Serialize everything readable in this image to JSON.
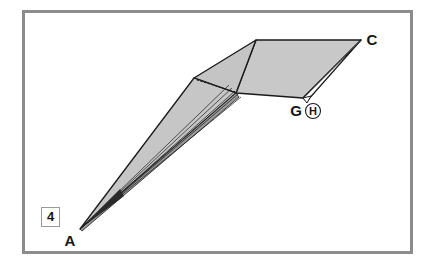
{
  "figure": {
    "number": "4",
    "frame_color": "#8c8c8c",
    "background_color": "#ffffff",
    "fill_color": "#c8c8c8",
    "fill_color_dark": "#b4b4b4",
    "outline_color": "#1a1a1a",
    "label_color": "#151515",
    "canvas": {
      "width": 433,
      "height": 271
    }
  },
  "labels": {
    "apex": "A",
    "far_corner": "C",
    "near_corner": "G",
    "callout": "H"
  },
  "geometry": {
    "points": {
      "A": {
        "x": 80,
        "y": 229
      },
      "B": {
        "x": 194,
        "y": 78
      },
      "T": {
        "x": 256,
        "y": 40
      },
      "C": {
        "x": 361,
        "y": 40
      },
      "G": {
        "x": 303,
        "y": 98
      },
      "F": {
        "x": 236,
        "y": 93
      },
      "S": {
        "x": 307,
        "y": 101
      }
    },
    "fan_line_count": 5,
    "dotted_edge": {
      "from": "B",
      "to": "F"
    }
  },
  "annotations": {
    "figure_box_label": "4",
    "circled_callout": "H"
  }
}
